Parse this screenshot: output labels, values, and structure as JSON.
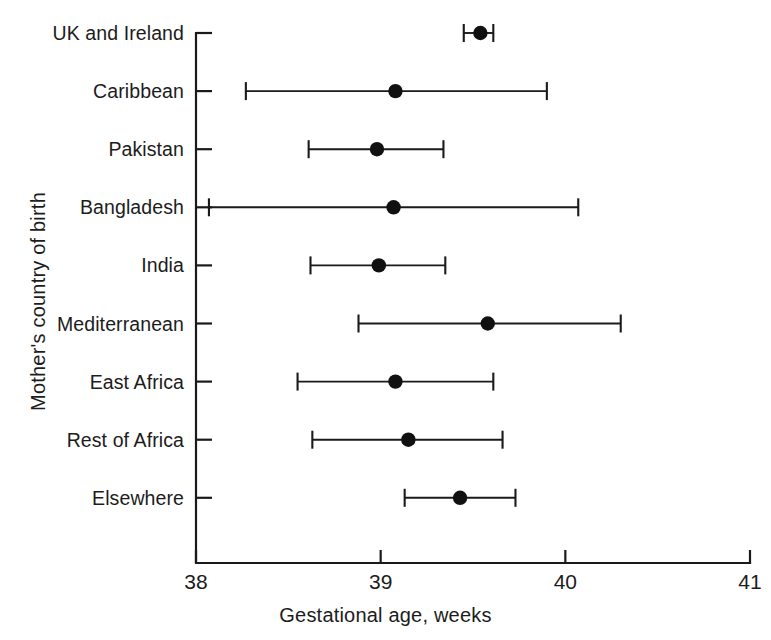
{
  "chart_data": {
    "type": "scatter",
    "title": "",
    "subtitle": "",
    "xlabel": "Gestational age, weeks",
    "ylabel": "Mother's country of birth",
    "xlim": [
      38,
      41
    ],
    "xticks": [
      38,
      39,
      40,
      41
    ],
    "xtick_labels": [
      "38",
      "39",
      "40",
      "41"
    ],
    "grid": false,
    "legend": null,
    "orientation": "horizontal",
    "error_bars": "confidence-interval",
    "categories": [
      "UK and Ireland",
      "Caribbean",
      "Pakistan",
      "Bangladesh",
      "India",
      "Mediterranean",
      "East Africa",
      "Rest of Africa",
      "Elsewhere"
    ],
    "values": [
      39.54,
      39.08,
      38.98,
      39.07,
      38.99,
      39.58,
      39.08,
      39.15,
      39.43
    ],
    "ci_low": [
      39.45,
      38.27,
      38.61,
      38.07,
      38.62,
      38.88,
      38.55,
      38.63,
      39.13
    ],
    "ci_high": [
      39.61,
      39.9,
      39.34,
      40.07,
      39.35,
      40.3,
      39.61,
      39.66,
      39.73
    ],
    "points": [
      {
        "label": "UK and Ireland",
        "value": 39.54,
        "low": 39.45,
        "high": 39.61
      },
      {
        "label": "Caribbean",
        "value": 39.08,
        "low": 38.27,
        "high": 39.9
      },
      {
        "label": "Pakistan",
        "value": 38.98,
        "low": 38.61,
        "high": 39.34
      },
      {
        "label": "Bangladesh",
        "value": 39.07,
        "low": 38.07,
        "high": 40.07
      },
      {
        "label": "India",
        "value": 38.99,
        "low": 38.62,
        "high": 39.35
      },
      {
        "label": "Mediterranean",
        "value": 39.58,
        "low": 38.88,
        "high": 40.3
      },
      {
        "label": "East Africa",
        "value": 39.08,
        "low": 38.55,
        "high": 39.61
      },
      {
        "label": "Rest of Africa",
        "value": 39.15,
        "low": 38.63,
        "high": 39.66
      },
      {
        "label": "Elsewhere",
        "value": 39.43,
        "low": 39.13,
        "high": 39.73
      }
    ],
    "colors": {
      "marker": "#111111",
      "line": "#1a1a1a",
      "axis": "#1a1a1a",
      "background": "#ffffff",
      "text": "#1c1c1c"
    }
  }
}
